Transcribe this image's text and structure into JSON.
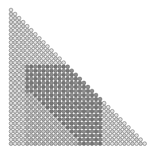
{
  "figure": {
    "title": "triangular-dot-matrix",
    "description": "Lower-left triangular lattice of small circles with a darker shaded rectangular block and a lighter interior wedge",
    "width": 156,
    "height": 156,
    "background": "#ffffff"
  },
  "grid": {
    "shape": "lower-left-triangle",
    "columns": 34,
    "rows": 34,
    "origin_x": 11.0,
    "origin_y": 10.0,
    "spacing_x": 4.05,
    "spacing_y": 4.05,
    "circle_radius": 1.85,
    "stroke_color": "#4a4a4a",
    "stroke_width": 0.45,
    "total_circles": 595
  },
  "palette": {
    "base_fill": "#e3e3e3",
    "alt_fill": "#cfcfcf",
    "dark_fill": "#8e8e8e",
    "dark_alt_fill": "#7a7a7a",
    "wedge_fill": "#c6c6c6",
    "wedge_alt_fill": "#b4b4b4",
    "outline": "#4a4a4a"
  },
  "chart_data": {
    "type": "heatmap",
    "title": "triangular-dot-matrix",
    "xlabel": "",
    "ylabel": "",
    "columns": 34,
    "rows": 34,
    "mask": "col <= row",
    "regions": [
      {
        "name": "base-region",
        "level": 0,
        "fill": "#e3e3e3",
        "col_range": [
          0,
          33
        ],
        "row_range": [
          0,
          33
        ]
      },
      {
        "name": "dark-block",
        "level": 2,
        "fill": "#8e8e8e",
        "col_range": [
          4,
          22
        ],
        "row_range": [
          14,
          33
        ]
      },
      {
        "name": "light-wedge",
        "level": 1,
        "fill": "#c6c6c6",
        "col_range": [
          4,
          16
        ],
        "row_range": [
          21,
          33
        ],
        "note": "triangular wedge widening downward inside dark block"
      }
    ]
  }
}
